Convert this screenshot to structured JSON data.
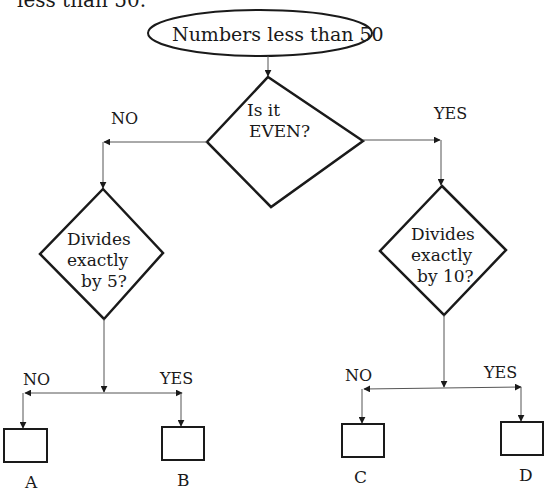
{
  "caption_fragment": "less than 50.",
  "start": {
    "label": "Numbers less than 50"
  },
  "decision_main": {
    "line1": "Is it",
    "line2": "EVEN?",
    "no_label": "NO",
    "yes_label": "YES"
  },
  "decision_left": {
    "line1": "Divides",
    "line2": "exactly",
    "line3": "by 5?",
    "no_label": "NO",
    "yes_label": "YES"
  },
  "decision_right": {
    "line1": "Divides",
    "line2": "exactly",
    "line3": "by 10?",
    "no_label": "NO",
    "yes_label": "YES"
  },
  "outcomes": [
    {
      "label": "A"
    },
    {
      "label": "B"
    },
    {
      "label": "C"
    },
    {
      "label": "D"
    }
  ],
  "colors": {
    "stroke": "#1a1a1a",
    "connector": "#555555",
    "background": "#ffffff"
  }
}
